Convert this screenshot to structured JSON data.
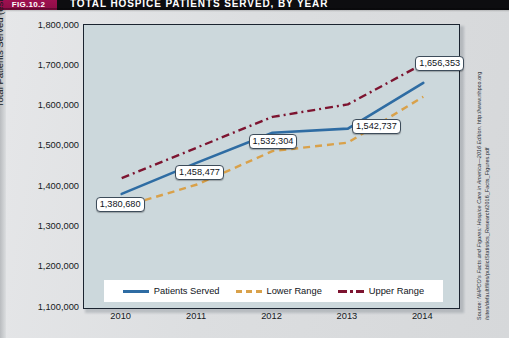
{
  "banner": {
    "fig_tag": "FIG.10.2",
    "title": "TOTAL HOSPICE PATIENTS SERVED, BY YEAR"
  },
  "source": {
    "line1": "Source: NHPCO's Facts and Figures: Hospice Care in America—2016 Edition. http://www.nhpco.org",
    "line2": "/sites/default/files/public/Statistics_Research/2016_Facts_Figures.pdf"
  },
  "legend": {
    "items": [
      {
        "label": "Patients Served",
        "style": "solid",
        "color": "#2e6ca3"
      },
      {
        "label": "Lower Range",
        "style": "dashed",
        "color": "#d9a14a"
      },
      {
        "label": "Upper Range",
        "style": "dash-dot",
        "color": "#7d1430"
      }
    ]
  },
  "chart_data": {
    "type": "line",
    "title": "TOTAL HOSPICE PATIENTS SERVED, BY YEAR",
    "xlabel": "",
    "ylabel": "Total Patients Served (estimate)",
    "categories": [
      "2010",
      "2011",
      "2012",
      "2013",
      "2014"
    ],
    "x": [
      2010,
      2011,
      2012,
      2013,
      2014
    ],
    "ylim": [
      1100000,
      1800000
    ],
    "yticks": [
      "1,100,000",
      "1,200,000",
      "1,300,000",
      "1,400,000",
      "1,500,000",
      "1,600,000",
      "1,700,000",
      "1,800,000"
    ],
    "ytick_values": [
      1100000,
      1200000,
      1300000,
      1400000,
      1500000,
      1600000,
      1700000,
      1800000
    ],
    "grid": false,
    "legend_position": "bottom",
    "series": [
      {
        "name": "Patients Served",
        "color": "#2e6ca3",
        "style": "solid",
        "values": [
          1380680,
          1458477,
          1532304,
          1542737,
          1656353
        ],
        "data_labels": [
          "1,380,680",
          "1,458,477",
          "1,532,304",
          "1,542,737",
          "1,656,353"
        ]
      },
      {
        "name": "Lower Range",
        "color": "#d9a14a",
        "style": "dashed",
        "values": [
          1348000,
          1404000,
          1487000,
          1508000,
          1622000
        ]
      },
      {
        "name": "Upper Range",
        "color": "#7d1430",
        "style": "dash-dot",
        "values": [
          1420000,
          1496000,
          1572000,
          1603000,
          1704000
        ]
      }
    ]
  }
}
